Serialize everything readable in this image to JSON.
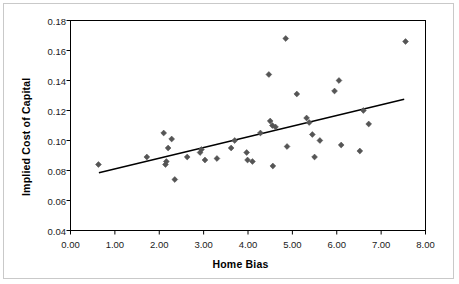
{
  "chart_data": {
    "type": "scatter",
    "title": "",
    "xlabel": "Home Bias",
    "ylabel": "Implied Cost of Capital",
    "xlim": [
      0.0,
      8.0
    ],
    "ylim": [
      0.04,
      0.18
    ],
    "grid": false,
    "legend": null,
    "xticks": [
      "0.00",
      "1.00",
      "2.00",
      "3.00",
      "4.00",
      "5.00",
      "6.00",
      "7.00",
      "8.00"
    ],
    "xtick_values": [
      0.0,
      1.0,
      2.0,
      3.0,
      4.0,
      5.0,
      6.0,
      7.0,
      8.0
    ],
    "yticks": [
      "0.04",
      "0.06",
      "0.08",
      "0.10",
      "0.12",
      "0.14",
      "0.16",
      "0.18"
    ],
    "ytick_values": [
      0.04,
      0.06,
      0.08,
      0.1,
      0.12,
      0.14,
      0.16,
      0.18
    ],
    "marker_color": "#555555",
    "line_color": "#000000",
    "axis_color": "#000000",
    "series": [
      {
        "name": "Countries",
        "marker": "diamond",
        "points": [
          [
            0.63,
            0.084
          ],
          [
            1.72,
            0.089
          ],
          [
            2.1,
            0.105
          ],
          [
            2.14,
            0.084
          ],
          [
            2.16,
            0.086
          ],
          [
            2.2,
            0.095
          ],
          [
            2.28,
            0.101
          ],
          [
            2.35,
            0.074
          ],
          [
            2.63,
            0.089
          ],
          [
            2.92,
            0.092
          ],
          [
            2.95,
            0.094
          ],
          [
            3.03,
            0.087
          ],
          [
            3.3,
            0.088
          ],
          [
            3.62,
            0.095
          ],
          [
            3.7,
            0.1
          ],
          [
            3.97,
            0.092
          ],
          [
            3.99,
            0.087
          ],
          [
            4.1,
            0.086
          ],
          [
            4.28,
            0.105
          ],
          [
            4.47,
            0.144
          ],
          [
            4.5,
            0.113
          ],
          [
            4.55,
            0.11
          ],
          [
            4.56,
            0.083
          ],
          [
            4.62,
            0.109
          ],
          [
            4.85,
            0.168
          ],
          [
            4.88,
            0.096
          ],
          [
            5.1,
            0.131
          ],
          [
            5.32,
            0.115
          ],
          [
            5.38,
            0.112
          ],
          [
            5.45,
            0.104
          ],
          [
            5.5,
            0.089
          ],
          [
            5.62,
            0.1
          ],
          [
            5.95,
            0.133
          ],
          [
            6.05,
            0.14
          ],
          [
            6.1,
            0.097
          ],
          [
            6.52,
            0.093
          ],
          [
            6.6,
            0.12
          ],
          [
            6.72,
            0.111
          ],
          [
            7.55,
            0.166
          ]
        ]
      }
    ],
    "trendline": {
      "name": "Linear fit",
      "x_start": 0.64,
      "y_start": 0.0785,
      "x_end": 7.52,
      "y_end": 0.1275
    }
  }
}
